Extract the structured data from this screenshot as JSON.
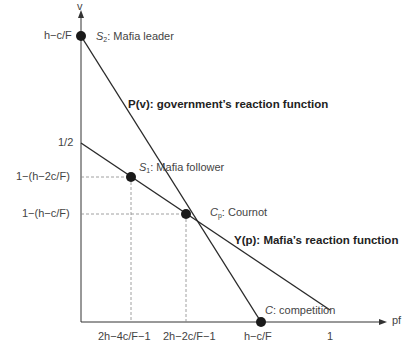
{
  "axes": {
    "y_label": "v",
    "x_label": "pf"
  },
  "y_ticks": [
    {
      "label": "h−c/F",
      "y": 36
    },
    {
      "label": "1/2",
      "y": 143
    },
    {
      "label": "1−(h−2c/F)",
      "y": 177
    },
    {
      "label": "1−(h−c/F)",
      "y": 214
    }
  ],
  "x_ticks": [
    {
      "label": "2h−4c/F−1",
      "x": 131
    },
    {
      "label": "2h−2c/F−1",
      "x": 186
    },
    {
      "label": "h−c/F",
      "x": 261
    },
    {
      "label": "1",
      "x": 330
    }
  ],
  "points": {
    "s2": {
      "symbol": "S",
      "sub": "2",
      "text": ": Mafia leader"
    },
    "s1": {
      "symbol": "S",
      "sub": "1",
      "text": ": Mafia follower"
    },
    "cp": {
      "symbol": "C",
      "sub": "p",
      "text": ": Cournot"
    },
    "c": {
      "symbol": "C",
      "text": ": competition"
    }
  },
  "curves": {
    "government": "P(v): government’s reaction function",
    "mafia": "Y(p): Mafia’s reaction function"
  },
  "colors": {
    "line": "#2a2a2a",
    "dash": "#888888",
    "point": "#1a1a1a"
  }
}
